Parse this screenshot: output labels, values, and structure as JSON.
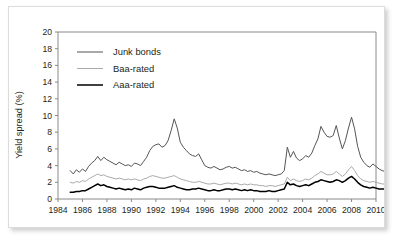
{
  "figure": {
    "background_color": "#ffffff",
    "border_color": "#dcdcdc"
  },
  "chart_data": {
    "type": "line",
    "title": "",
    "xlabel": "",
    "ylabel": "Yield spread (%)",
    "xlim": [
      1984,
      2010
    ],
    "ylim": [
      0,
      20
    ],
    "xticks": [
      1984,
      1986,
      1988,
      1990,
      1992,
      1994,
      1996,
      1998,
      2000,
      2002,
      2004,
      2006,
      2008,
      2010
    ],
    "yticks": [
      0,
      2,
      4,
      6,
      8,
      10,
      12,
      14,
      16,
      18,
      20
    ],
    "xtick_labels": [
      "1984",
      "1986",
      "1988",
      "1990",
      "1992",
      "1994",
      "1996",
      "1998",
      "2000",
      "2002",
      "2004",
      "2006",
      "2008",
      "2010"
    ],
    "ytick_labels": [
      "0",
      "2",
      "4",
      "6",
      "8",
      "10",
      "12",
      "14",
      "16",
      "18",
      "20"
    ],
    "grid": false,
    "legend_position": "upper-left",
    "x_start": 1985.0,
    "x_step": 0.25,
    "series": [
      {
        "name": "Junk bonds",
        "color": "#555555",
        "width": 1.0,
        "values": [
          3.4,
          3.0,
          3.5,
          3.2,
          3.6,
          3.3,
          3.9,
          4.3,
          4.6,
          5.1,
          4.6,
          5.0,
          4.7,
          4.5,
          4.3,
          4.1,
          4.4,
          4.2,
          4.0,
          4.1,
          3.9,
          4.3,
          4.2,
          4.0,
          4.5,
          5.0,
          5.8,
          6.3,
          6.5,
          6.6,
          6.2,
          6.4,
          7.0,
          8.2,
          9.6,
          8.5,
          6.8,
          6.2,
          5.8,
          5.4,
          5.2,
          5.1,
          5.4,
          4.7,
          4.0,
          3.8,
          3.7,
          3.9,
          3.7,
          3.5,
          3.6,
          3.8,
          3.9,
          3.7,
          3.8,
          3.6,
          3.4,
          3.5,
          3.3,
          3.4,
          3.2,
          3.3,
          3.1,
          3.0,
          2.9,
          3.0,
          2.9,
          2.8,
          2.9,
          3.0,
          3.4,
          6.2,
          5.0,
          5.7,
          4.9,
          4.6,
          4.8,
          5.2,
          5.0,
          5.5,
          6.4,
          7.2,
          8.7,
          8.0,
          7.5,
          7.4,
          7.6,
          8.8,
          7.3,
          6.0,
          7.0,
          8.5,
          9.8,
          8.4,
          6.3,
          5.0,
          4.4,
          4.0,
          3.8,
          4.2,
          3.9,
          3.6,
          3.4,
          3.3,
          3.1,
          3.0,
          3.1,
          3.2,
          3.0,
          3.1,
          3.3,
          4.6,
          5.6,
          7.6,
          6.6,
          9.4,
          18.3,
          15.5,
          16.4,
          12.0,
          9.5,
          8.0
        ]
      },
      {
        "name": "Baa-rated",
        "color": "#aaaaaa",
        "width": 1.0,
        "values": [
          2.0,
          1.9,
          2.1,
          2.0,
          2.2,
          2.1,
          2.4,
          2.6,
          2.8,
          3.0,
          2.8,
          2.9,
          2.7,
          2.6,
          2.5,
          2.4,
          2.5,
          2.4,
          2.3,
          2.4,
          2.3,
          2.4,
          2.3,
          2.2,
          2.4,
          2.5,
          2.7,
          2.8,
          2.7,
          2.6,
          2.5,
          2.5,
          2.6,
          2.7,
          2.8,
          2.6,
          2.4,
          2.3,
          2.2,
          2.1,
          2.0,
          2.0,
          2.1,
          2.0,
          1.9,
          1.8,
          1.8,
          1.9,
          1.8,
          1.7,
          1.8,
          1.9,
          1.9,
          1.8,
          1.9,
          1.8,
          1.7,
          1.8,
          1.7,
          1.8,
          1.7,
          1.7,
          1.6,
          1.6,
          1.5,
          1.6,
          1.6,
          1.5,
          1.6,
          1.7,
          1.8,
          2.6,
          2.2,
          2.4,
          2.2,
          2.1,
          2.2,
          2.4,
          2.3,
          2.5,
          2.8,
          3.0,
          3.3,
          3.1,
          2.9,
          2.9,
          3.0,
          3.3,
          3.0,
          2.7,
          3.0,
          3.5,
          3.9,
          3.4,
          2.8,
          2.4,
          2.2,
          2.1,
          2.0,
          2.1,
          2.0,
          1.9,
          1.8,
          1.8,
          1.7,
          1.7,
          1.8,
          1.8,
          1.7,
          1.8,
          1.9,
          2.3,
          2.6,
          3.2,
          3.0,
          3.9,
          6.2,
          5.4,
          5.6,
          4.4,
          3.7,
          3.3
        ]
      },
      {
        "name": "Aaa-rated",
        "color": "#000000",
        "width": 1.5,
        "values": [
          0.8,
          0.8,
          0.9,
          0.9,
          1.0,
          1.0,
          1.2,
          1.4,
          1.6,
          1.8,
          1.6,
          1.7,
          1.5,
          1.4,
          1.3,
          1.2,
          1.3,
          1.2,
          1.1,
          1.2,
          1.1,
          1.3,
          1.2,
          1.1,
          1.3,
          1.4,
          1.5,
          1.5,
          1.4,
          1.3,
          1.3,
          1.3,
          1.4,
          1.5,
          1.6,
          1.4,
          1.3,
          1.2,
          1.1,
          1.1,
          1.2,
          1.2,
          1.3,
          1.2,
          1.1,
          1.0,
          1.0,
          1.1,
          1.0,
          1.0,
          1.1,
          1.2,
          1.2,
          1.1,
          1.2,
          1.1,
          1.0,
          1.1,
          1.0,
          1.1,
          1.0,
          1.0,
          0.9,
          0.9,
          0.9,
          1.0,
          0.9,
          0.9,
          1.0,
          1.1,
          1.2,
          2.0,
          1.7,
          1.8,
          1.6,
          1.5,
          1.6,
          1.7,
          1.6,
          1.8,
          2.0,
          2.1,
          2.3,
          2.2,
          2.1,
          2.0,
          2.1,
          2.3,
          2.2,
          2.0,
          2.2,
          2.5,
          2.7,
          2.4,
          2.0,
          1.7,
          1.5,
          1.4,
          1.3,
          1.4,
          1.3,
          1.2,
          1.2,
          1.2,
          1.1,
          1.1,
          1.2,
          1.2,
          1.1,
          1.2,
          1.3,
          1.5,
          1.7,
          2.0,
          1.9,
          2.3,
          3.0,
          2.8,
          2.9,
          2.5,
          2.2,
          2.0
        ]
      }
    ]
  }
}
